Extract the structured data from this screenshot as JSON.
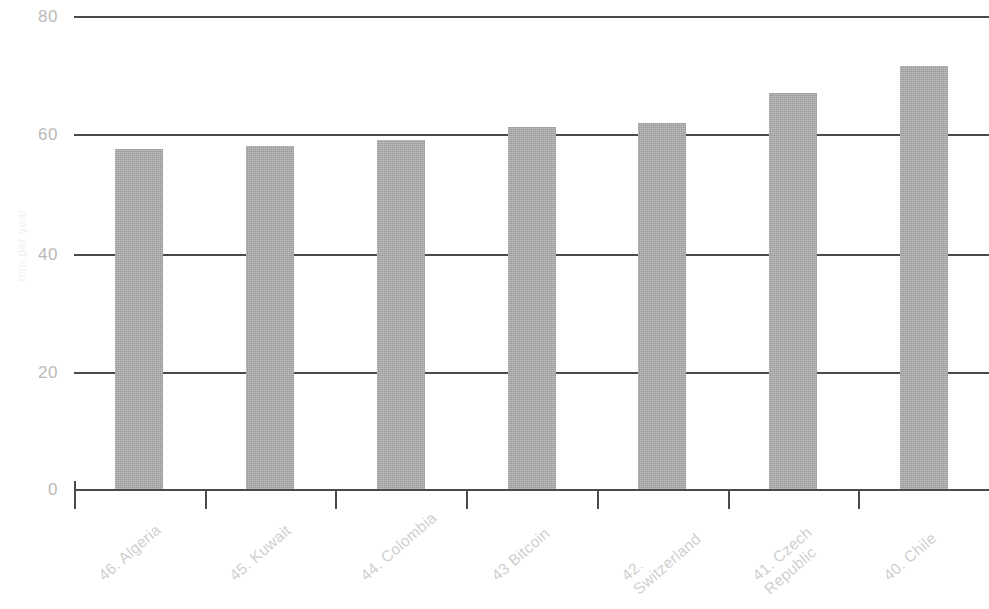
{
  "chart_data": {
    "type": "bar",
    "title": "",
    "subtitle": "",
    "xlabel": "",
    "ylabel": "mm per year",
    "categories": [
      "46. Algeria",
      "45. Kuwait",
      "44. Colombia",
      "43 Bitcoin",
      "42.\nSwitzerland",
      "41. Czech\nRepublic",
      "40. Chile"
    ],
    "values": [
      57.5,
      58.0,
      59.0,
      61.2,
      61.9,
      67.0,
      71.6
    ],
    "ylim": [
      0,
      80
    ],
    "ytick_labels": [
      "0",
      "20",
      "40",
      "60",
      "80"
    ],
    "ytick_values": [
      0,
      20,
      40,
      60,
      80
    ],
    "grid": true,
    "legend": "none",
    "bar_color": "#a9a9a9",
    "gridline_color": "#4a4a4a",
    "tick_label_color": "#b9b9b9",
    "category_label_color": "#cfcfcf"
  }
}
